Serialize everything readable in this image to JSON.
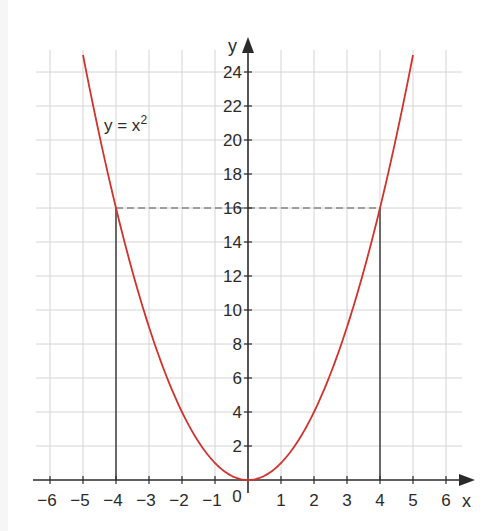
{
  "chart_data": {
    "type": "line",
    "title": "",
    "function_label": "y = x",
    "function_exponent": "2",
    "xlabel": "x",
    "ylabel": "y",
    "xlim": [
      -6,
      6
    ],
    "ylim": [
      0,
      25
    ],
    "x_ticks": [
      -6,
      -5,
      -4,
      -3,
      -2,
      -1,
      0,
      1,
      2,
      3,
      4,
      5,
      6
    ],
    "x_tick_labels": [
      "−6",
      "−5",
      "−4",
      "−3",
      "−2",
      "−1",
      "0",
      "1",
      "2",
      "3",
      "4",
      "5",
      "6"
    ],
    "y_ticks": [
      2,
      4,
      6,
      8,
      10,
      12,
      14,
      16,
      18,
      20,
      22,
      24
    ],
    "y_tick_labels": [
      "2",
      "4",
      "6",
      "8",
      "10",
      "12",
      "14",
      "16",
      "18",
      "20",
      "22",
      "24"
    ],
    "grid": true,
    "series": [
      {
        "name": "y = x^2",
        "color": "#d2322d",
        "x": [
          -5,
          -4,
          -3,
          -2,
          -1,
          0,
          1,
          2,
          3,
          4,
          5
        ],
        "y": [
          25,
          16,
          9,
          4,
          1,
          0,
          1,
          4,
          9,
          16,
          25
        ]
      }
    ],
    "annotations": [
      {
        "type": "dashed-horizontal",
        "y": 16,
        "from_x": -4,
        "to_x": 4,
        "color": "#555555"
      },
      {
        "type": "vertical-line",
        "x": -4,
        "from_y": 0,
        "to_y": 16,
        "color": "#333333"
      },
      {
        "type": "vertical-line",
        "x": 4,
        "from_y": 0,
        "to_y": 16,
        "color": "#333333"
      }
    ],
    "colors": {
      "curve": "#d2322d",
      "axis": "#2b2b2b",
      "grid": "#d4d4d4",
      "background": "#ffffff"
    }
  }
}
